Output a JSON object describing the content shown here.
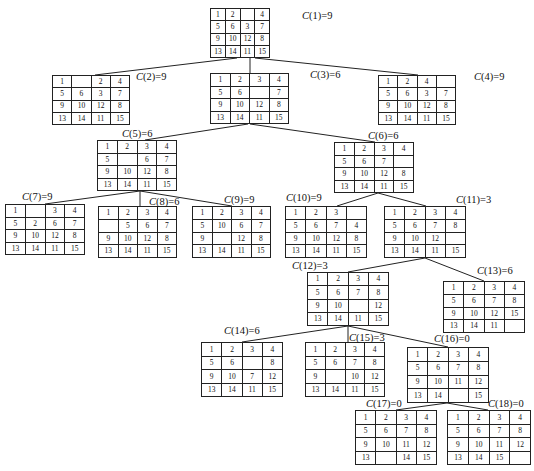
{
  "nodes": [
    {
      "id": 1,
      "label": "C(1)=9",
      "cost": 9,
      "x": 210,
      "y": 8,
      "w": 60,
      "h": 50,
      "lx": 302,
      "ly": 10,
      "grid": [
        [
          "1",
          "2",
          "",
          "4"
        ],
        [
          "5",
          "6",
          "3",
          "7"
        ],
        [
          "9",
          "10",
          "12",
          "8"
        ],
        [
          "13",
          "14",
          "11",
          "15"
        ]
      ]
    },
    {
      "id": 2,
      "label": "C(2)=9",
      "cost": 9,
      "x": 52,
      "y": 75,
      "w": 78,
      "h": 50,
      "lx": 136,
      "ly": 71,
      "grid": [
        [
          "1",
          "",
          "2",
          "4"
        ],
        [
          "5",
          "6",
          "3",
          "7"
        ],
        [
          "9",
          "10",
          "12",
          "8"
        ],
        [
          "13",
          "14",
          "11",
          "15"
        ]
      ]
    },
    {
      "id": 3,
      "label": "C(3)=6",
      "cost": 6,
      "x": 210,
      "y": 73,
      "w": 79,
      "h": 51,
      "lx": 310,
      "ly": 69,
      "grid": [
        [
          "1",
          "2",
          "3",
          "4"
        ],
        [
          "5",
          "6",
          "",
          "7"
        ],
        [
          "9",
          "10",
          "12",
          "8"
        ],
        [
          "13",
          "14",
          "11",
          "15"
        ]
      ]
    },
    {
      "id": 4,
      "label": "C(4)=9",
      "cost": 9,
      "x": 378,
      "y": 75,
      "w": 78,
      "h": 50,
      "lx": 474,
      "ly": 71,
      "grid": [
        [
          "1",
          "2",
          "4",
          ""
        ],
        [
          "5",
          "6",
          "3",
          "7"
        ],
        [
          "9",
          "10",
          "12",
          "8"
        ],
        [
          "13",
          "14",
          "11",
          "15"
        ]
      ]
    },
    {
      "id": 5,
      "label": "C(5)=6",
      "cost": 6,
      "x": 97,
      "y": 140,
      "w": 80,
      "h": 51,
      "lx": 122,
      "ly": 128,
      "grid": [
        [
          "1",
          "2",
          "3",
          "4"
        ],
        [
          "5",
          "",
          "6",
          "7"
        ],
        [
          "9",
          "10",
          "12",
          "8"
        ],
        [
          "13",
          "14",
          "11",
          "15"
        ]
      ]
    },
    {
      "id": 6,
      "label": "C(6)=6",
      "cost": 6,
      "x": 334,
      "y": 142,
      "w": 80,
      "h": 51,
      "lx": 368,
      "ly": 130,
      "grid": [
        [
          "1",
          "2",
          "3",
          "4"
        ],
        [
          "5",
          "6",
          "7",
          ""
        ],
        [
          "9",
          "10",
          "12",
          "8"
        ],
        [
          "13",
          "14",
          "11",
          "15"
        ]
      ]
    },
    {
      "id": 7,
      "label": "C(7)=9",
      "cost": 9,
      "x": 5,
      "y": 204,
      "w": 80,
      "h": 51,
      "lx": 22,
      "ly": 191,
      "grid": [
        [
          "1",
          "",
          "3",
          "4"
        ],
        [
          "5",
          "2",
          "6",
          "7"
        ],
        [
          "9",
          "10",
          "12",
          "8"
        ],
        [
          "13",
          "14",
          "11",
          "15"
        ]
      ]
    },
    {
      "id": 8,
      "label": "C(8)=6",
      "cost": 6,
      "x": 98,
      "y": 206,
      "w": 79,
      "h": 52,
      "lx": 149,
      "ly": 196,
      "grid": [
        [
          "1",
          "2",
          "3",
          "4"
        ],
        [
          "",
          "5",
          "6",
          "7"
        ],
        [
          "9",
          "10",
          "12",
          "8"
        ],
        [
          "13",
          "14",
          "11",
          "15"
        ]
      ]
    },
    {
      "id": 9,
      "label": "C(9)=9",
      "cost": 9,
      "x": 192,
      "y": 206,
      "w": 79,
      "h": 52,
      "lx": 224,
      "ly": 194,
      "grid": [
        [
          "1",
          "2",
          "3",
          "4"
        ],
        [
          "5",
          "10",
          "6",
          "7"
        ],
        [
          "9",
          "",
          "12",
          "8"
        ],
        [
          "13",
          "14",
          "11",
          "15"
        ]
      ]
    },
    {
      "id": 10,
      "label": "C(10)=9",
      "cost": 9,
      "x": 285,
      "y": 206,
      "w": 82,
      "h": 52,
      "lx": 286,
      "ly": 192,
      "grid": [
        [
          "1",
          "2",
          "3",
          ""
        ],
        [
          "5",
          "6",
          "7",
          "4"
        ],
        [
          "9",
          "10",
          "12",
          "8"
        ],
        [
          "13",
          "14",
          "11",
          "15"
        ]
      ]
    },
    {
      "id": 11,
      "label": "C(11)=3",
      "cost": 3,
      "x": 384,
      "y": 206,
      "w": 82,
      "h": 52,
      "lx": 456,
      "ly": 194,
      "grid": [
        [
          "1",
          "2",
          "3",
          "4"
        ],
        [
          "5",
          "6",
          "7",
          "8"
        ],
        [
          "9",
          "10",
          "12",
          ""
        ],
        [
          "13",
          "14",
          "11",
          "15"
        ]
      ]
    },
    {
      "id": 12,
      "label": "C(12)=3",
      "cost": 3,
      "x": 307,
      "y": 272,
      "w": 82,
      "h": 54,
      "lx": 292,
      "ly": 260,
      "grid": [
        [
          "1",
          "2",
          "3",
          "4"
        ],
        [
          "5",
          "6",
          "7",
          "8"
        ],
        [
          "9",
          "10",
          "",
          "12"
        ],
        [
          "13",
          "14",
          "11",
          "15"
        ]
      ]
    },
    {
      "id": 13,
      "label": "C(13)=6",
      "cost": 6,
      "x": 443,
      "y": 281,
      "w": 82,
      "h": 52,
      "lx": 477,
      "ly": 265,
      "grid": [
        [
          "1",
          "2",
          "3",
          "4"
        ],
        [
          "5",
          "6",
          "7",
          "8"
        ],
        [
          "9",
          "10",
          "12",
          "15"
        ],
        [
          "13",
          "14",
          "11",
          ""
        ]
      ]
    },
    {
      "id": 14,
      "label": "C(14)=6",
      "cost": 6,
      "x": 201,
      "y": 342,
      "w": 82,
      "h": 55,
      "lx": 224,
      "ly": 325,
      "grid": [
        [
          "1",
          "2",
          "3",
          "4"
        ],
        [
          "5",
          "6",
          "",
          "8"
        ],
        [
          "9",
          "10",
          "7",
          "12"
        ],
        [
          "13",
          "14",
          "11",
          "15"
        ]
      ]
    },
    {
      "id": 15,
      "label": "C(15)=3",
      "cost": 3,
      "x": 305,
      "y": 342,
      "w": 80,
      "h": 55,
      "lx": 349,
      "ly": 332,
      "grid": [
        [
          "1",
          "2",
          "3",
          "4"
        ],
        [
          "5",
          "6",
          "7",
          "8"
        ],
        [
          "9",
          "",
          "10",
          "12"
        ],
        [
          "13",
          "14",
          "11",
          "15"
        ]
      ]
    },
    {
      "id": 16,
      "label": "C(16)=0",
      "cost": 0,
      "x": 407,
      "y": 347,
      "w": 82,
      "h": 56,
      "lx": 434,
      "ly": 333,
      "grid": [
        [
          "1",
          "2",
          "3",
          "4"
        ],
        [
          "5",
          "6",
          "7",
          "8"
        ],
        [
          "9",
          "10",
          "11",
          "12"
        ],
        [
          "13",
          "14",
          "",
          "15"
        ]
      ]
    },
    {
      "id": 17,
      "label": "C(17)=0",
      "cost": 0,
      "x": 355,
      "y": 410,
      "w": 82,
      "h": 55,
      "lx": 366,
      "ly": 398,
      "grid": [
        [
          "1",
          "2",
          "3",
          "4"
        ],
        [
          "5",
          "6",
          "7",
          "8"
        ],
        [
          "9",
          "10",
          "11",
          "12"
        ],
        [
          "13",
          "",
          "14",
          "15"
        ]
      ]
    },
    {
      "id": 18,
      "label": "C(18)=0",
      "cost": 0,
      "x": 447,
      "y": 410,
      "w": 84,
      "h": 55,
      "lx": 488,
      "ly": 398,
      "grid": [
        [
          "1",
          "2",
          "3",
          "4"
        ],
        [
          "5",
          "6",
          "7",
          "8"
        ],
        [
          "9",
          "10",
          "11",
          "12"
        ],
        [
          "13",
          "14",
          "15",
          ""
        ]
      ]
    }
  ],
  "edges": [
    {
      "from": 1,
      "to": 2,
      "x1": 237,
      "y1": 58,
      "x2": 95,
      "y2": 75
    },
    {
      "from": 1,
      "to": 3,
      "x1": 250,
      "y1": 58,
      "x2": 250,
      "y2": 73
    },
    {
      "from": 1,
      "to": 4,
      "x1": 255,
      "y1": 58,
      "x2": 418,
      "y2": 75
    },
    {
      "from": 3,
      "to": 5,
      "x1": 248,
      "y1": 124,
      "x2": 145,
      "y2": 140
    },
    {
      "from": 3,
      "to": 6,
      "x1": 250,
      "y1": 124,
      "x2": 375,
      "y2": 142
    },
    {
      "from": 5,
      "to": 7,
      "x1": 140,
      "y1": 191,
      "x2": 45,
      "y2": 204
    },
    {
      "from": 5,
      "to": 8,
      "x1": 140,
      "y1": 191,
      "x2": 140,
      "y2": 206
    },
    {
      "from": 5,
      "to": 9,
      "x1": 140,
      "y1": 191,
      "x2": 232,
      "y2": 206
    },
    {
      "from": 6,
      "to": 10,
      "x1": 378,
      "y1": 193,
      "x2": 337,
      "y2": 206
    },
    {
      "from": 6,
      "to": 11,
      "x1": 378,
      "y1": 193,
      "x2": 426,
      "y2": 206
    },
    {
      "from": 11,
      "to": 12,
      "x1": 425,
      "y1": 258,
      "x2": 348,
      "y2": 272
    },
    {
      "from": 11,
      "to": 13,
      "x1": 425,
      "y1": 258,
      "x2": 484,
      "y2": 281
    },
    {
      "from": 12,
      "to": 14,
      "x1": 348,
      "y1": 326,
      "x2": 242,
      "y2": 342
    },
    {
      "from": 12,
      "to": 15,
      "x1": 348,
      "y1": 326,
      "x2": 348,
      "y2": 342
    },
    {
      "from": 12,
      "to": 16,
      "x1": 348,
      "y1": 326,
      "x2": 448,
      "y2": 347
    },
    {
      "from": 16,
      "to": 17,
      "x1": 447,
      "y1": 403,
      "x2": 396,
      "y2": 410
    },
    {
      "from": 16,
      "to": 18,
      "x1": 447,
      "y1": 403,
      "x2": 488,
      "y2": 410
    }
  ],
  "colors": {
    "line": "#222222",
    "text": "#111111",
    "background": "#ffffff"
  }
}
